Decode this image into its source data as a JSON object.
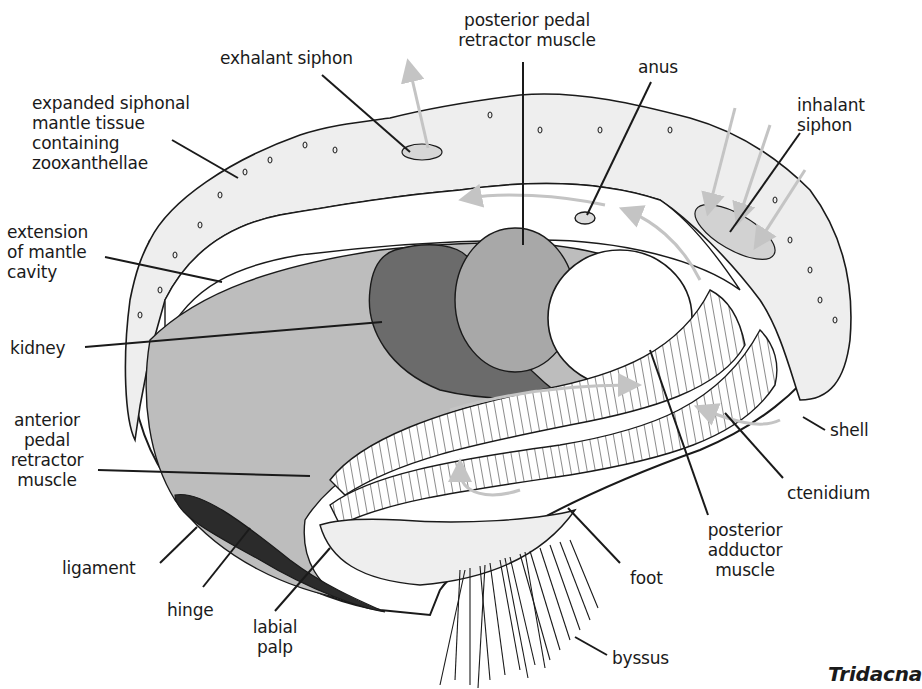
{
  "diagram": {
    "title": "Tridacna",
    "labels": {
      "exhalant_siphon": "exhalant siphon",
      "posterior_pedal_retractor": "posterior pedal\nretractor muscle",
      "anus": "anus",
      "expanded_mantle": "expanded siphonal\nmantle tissue\ncontaining\nzooxanthellae",
      "inhalant_siphon": "inhalant\nsiphon",
      "extension_mantle_cavity": "extension\nof mantle\ncavity",
      "kidney": "kidney",
      "anterior_pedal_retractor": "anterior\npedal\nretractor\nmuscle",
      "shell": "shell",
      "ctenidium": "ctenidium",
      "posterior_adductor": "posterior\nadductor\nmuscle",
      "ligament": "ligament",
      "foot": "foot",
      "hinge": "hinge",
      "labial_palp": "labial\npalp",
      "byssus": "byssus"
    },
    "colors": {
      "outline": "#1a1a1a",
      "mantle_fill": "#eeeeee",
      "cavity_fill": "#bdbdbd",
      "kidney_fill": "#6b6b6b",
      "retractor_fill": "#a8a8a8",
      "adductor_fill": "#ffffff",
      "ligament_fill": "#2b2b2b",
      "arrow": "#c4c4c4"
    }
  }
}
